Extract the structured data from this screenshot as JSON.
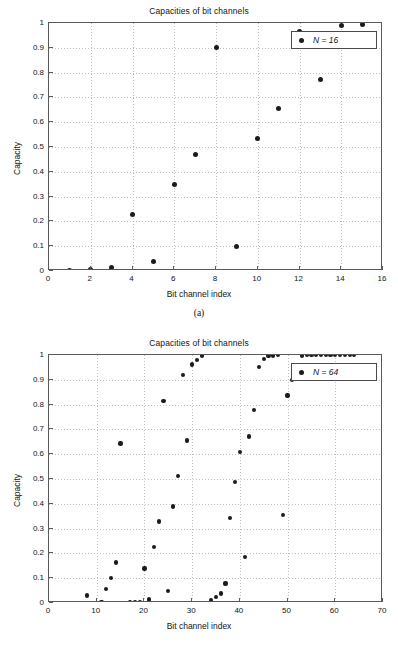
{
  "figure_a": {
    "title": "Capacities of bit channels",
    "xlabel": "Bit channel index",
    "ylabel": "Capacity",
    "caption": "(a)",
    "legend_label": "N = 16",
    "legend_marker": "filled-circle-marker",
    "xticks": [
      "0",
      "2",
      "4",
      "6",
      "8",
      "10",
      "12",
      "14",
      "16"
    ],
    "yticks": [
      "0",
      "0.1",
      "0.2",
      "0.3",
      "0.4",
      "0.5",
      "0.6",
      "0.7",
      "0.8",
      "0.9",
      "1"
    ]
  },
  "figure_b": {
    "title": "Capacities of bit channels",
    "xlabel": "Bit channel index",
    "ylabel": "Capacity",
    "caption": "(b)",
    "legend_label": "N = 64",
    "legend_marker": "filled-circle-marker",
    "xticks": [
      "0",
      "10",
      "20",
      "30",
      "40",
      "50",
      "60",
      "70"
    ],
    "yticks": [
      "0",
      "0.1",
      "0.2",
      "0.3",
      "0.4",
      "0.5",
      "0.6",
      "0.7",
      "0.8",
      "0.9",
      "1"
    ]
  },
  "colors": {
    "marker": "#1b1b1b",
    "axis": "#5a5a5a",
    "grid": "#bdbdbd",
    "background": "#ffffff"
  },
  "chart_data": [
    {
      "type": "scatter",
      "title": "Capacities of bit channels",
      "xlabel": "Bit channel index",
      "ylabel": "Capacity",
      "caption": "(a)",
      "xlim": [
        0,
        16
      ],
      "ylim": [
        0,
        1
      ],
      "xticks": [
        0,
        2,
        4,
        6,
        8,
        10,
        12,
        14,
        16
      ],
      "yticks": [
        0,
        0.1,
        0.2,
        0.3,
        0.4,
        0.5,
        0.6,
        0.7,
        0.8,
        0.9,
        1
      ],
      "grid": true,
      "legend": {
        "position": "upper-right",
        "entries": [
          "N = 16"
        ]
      },
      "series": [
        {
          "name": "N = 16",
          "marker": "filled-circle",
          "x": [
            1,
            2,
            3,
            4,
            5,
            6,
            7,
            8,
            9,
            10,
            11,
            12,
            13,
            14,
            15,
            16
          ],
          "values": [
            0.002,
            0.008,
            0.015,
            0.227,
            0.037,
            0.347,
            0.468,
            0.902,
            0.1,
            0.534,
            0.656,
            0.966,
            0.773,
            0.991,
            0.994,
            1.0
          ]
        }
      ]
    },
    {
      "type": "scatter",
      "title": "Capacities of bit channels",
      "xlabel": "Bit channel index",
      "ylabel": "Capacity",
      "caption": "(b)",
      "xlim": [
        0,
        70
      ],
      "ylim": [
        0,
        1
      ],
      "xticks": [
        0,
        10,
        20,
        30,
        40,
        50,
        60,
        70
      ],
      "yticks": [
        0,
        0.1,
        0.2,
        0.3,
        0.4,
        0.5,
        0.6,
        0.7,
        0.8,
        0.9,
        1
      ],
      "grid": true,
      "legend": {
        "position": "upper-right",
        "entries": [
          "N = 64"
        ]
      },
      "series": [
        {
          "name": "N = 64",
          "marker": "filled-circle",
          "x": [
            1,
            2,
            3,
            4,
            5,
            6,
            7,
            8,
            9,
            10,
            11,
            12,
            13,
            14,
            15,
            16,
            17,
            18,
            19,
            20,
            21,
            22,
            23,
            24,
            25,
            26,
            27,
            28,
            29,
            30,
            31,
            32,
            33,
            34,
            35,
            36,
            37,
            38,
            39,
            40,
            41,
            42,
            43,
            44,
            45,
            46,
            47,
            48,
            49,
            50,
            51,
            52,
            53,
            54,
            55,
            56,
            57,
            58,
            59,
            60,
            61,
            62,
            63,
            64
          ],
          "values": [
            0.0,
            0.0,
            0.0,
            0.0,
            0.0,
            0.0,
            0.0,
            0.03,
            0.0,
            0.001,
            0.002,
            0.057,
            0.1,
            0.163,
            0.643,
            0.0,
            0.002,
            0.003,
            0.005,
            0.139,
            0.014,
            0.226,
            0.329,
            0.816,
            0.048,
            0.389,
            0.513,
            0.919,
            0.655,
            0.962,
            0.981,
            0.998,
            0.001,
            0.011,
            0.024,
            0.038,
            0.079,
            0.344,
            0.488,
            0.609,
            0.184,
            0.671,
            0.777,
            0.951,
            0.985,
            0.997,
            0.998,
            1.0,
            0.356,
            0.837,
            0.899,
            0.944,
            0.998,
            1.0,
            1.0,
            1.0,
            1.0,
            1.0,
            1.0,
            1.0,
            1.0,
            1.0,
            1.0,
            1.0
          ]
        }
      ]
    }
  ]
}
